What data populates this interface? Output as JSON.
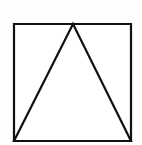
{
  "canvas": {
    "width": 142,
    "height": 145,
    "background_color": "#fefefe",
    "title": "Triangle inscribed in a square"
  },
  "figure": {
    "stroke_color": "#111111",
    "fill_color": "#ffffff",
    "stroke_width": 2.2,
    "shapes": [
      {
        "name": "square",
        "label": "Square",
        "points": "14,24 131,24 131,141 14,141",
        "vertices": [
          {
            "label": "top-left",
            "x": 14,
            "y": 24
          },
          {
            "label": "top-right",
            "x": 131,
            "y": 24
          },
          {
            "label": "bottom-right",
            "x": 131,
            "y": 141
          },
          {
            "label": "bottom-left",
            "x": 14,
            "y": 141
          }
        ],
        "side_length": 117
      },
      {
        "name": "triangle",
        "label": "Triangle",
        "points": "73,24 131,141 14,141",
        "vertices": [
          {
            "label": "apex",
            "x": 73,
            "y": 24
          },
          {
            "label": "base-right",
            "x": 131,
            "y": 141
          },
          {
            "label": "base-left",
            "x": 14,
            "y": 141
          }
        ],
        "base_length": 117,
        "height": 117
      }
    ]
  }
}
